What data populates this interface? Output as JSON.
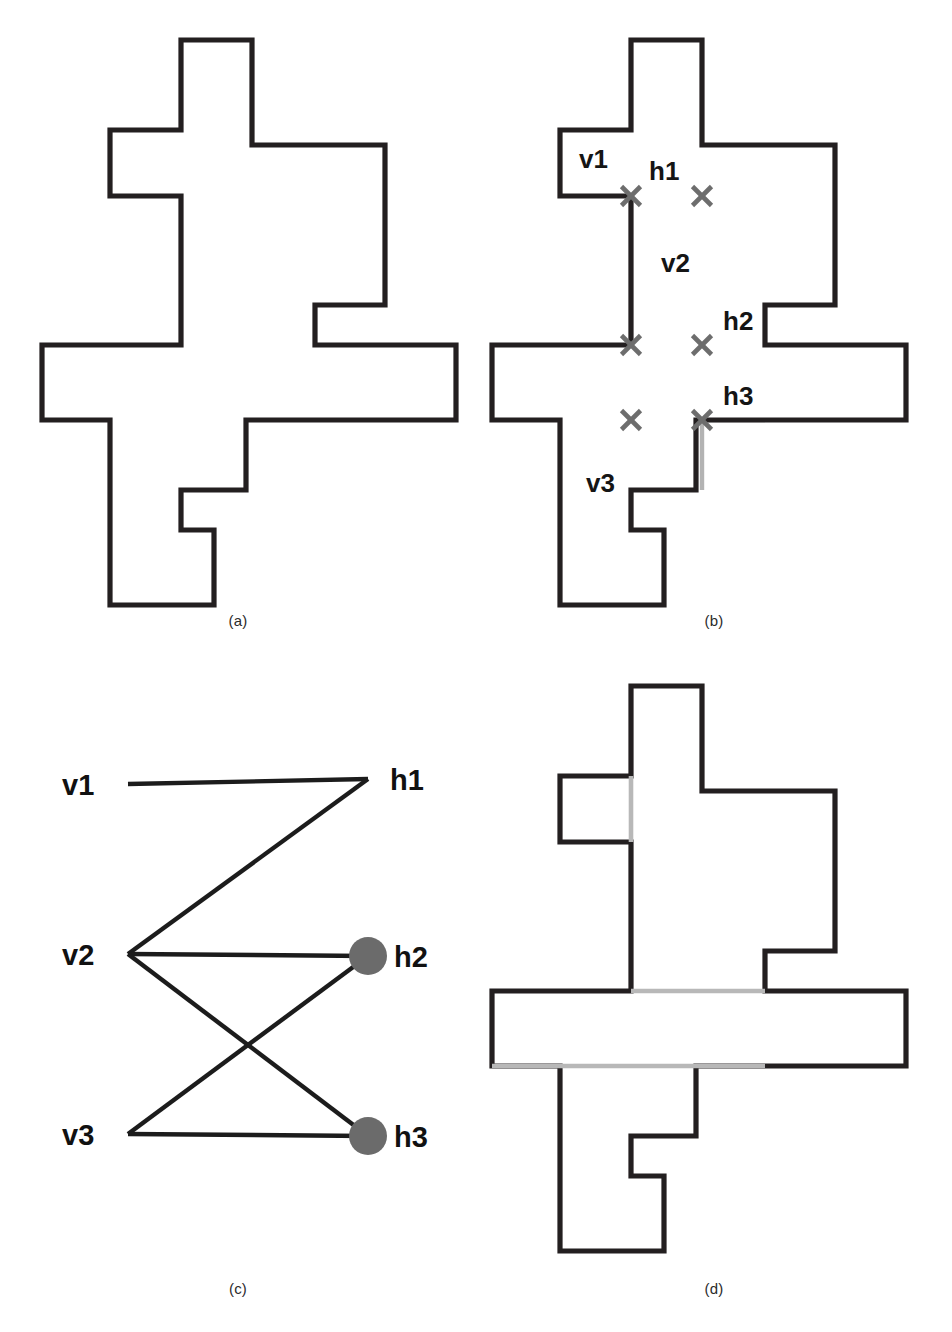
{
  "figure": {
    "panels": [
      {
        "key": "a",
        "caption": "(a)",
        "description": "input rectilinear polygon"
      },
      {
        "key": "b",
        "caption": "(b)",
        "description": "chords and their intersections"
      },
      {
        "key": "c",
        "caption": "(c)",
        "description": "bipartite intersection graph"
      },
      {
        "key": "d",
        "caption": "(d)",
        "description": "polygon partitioned using selected chords"
      }
    ]
  },
  "colors": {
    "outline": "#231f20",
    "chord_gray": "#b3b3b3",
    "cross_gray": "#6d6d6d",
    "node_fill": "#6b6b6b",
    "edge_black": "#1c1c1c",
    "background": "#ffffff"
  },
  "panel_a": {
    "caption": "(a)",
    "polygon_points": "181 40 252 40 252 145 385 145 385 305 315 305 315 345 456 345 456 420 246 420 246 490 181 490 181 530 214 530 214 605 110 605 110 420 42 420 42 345 181 345 181 196 110 196 110 130 181 130"
  },
  "panel_b": {
    "caption": "(b)",
    "polygon_points": "155 40 226 40 226 145 359 145 359 305 289 305 289 345 430 345 430 420 220 420 220 490 155 490 155 530 188 530 188 605 84 605 84 420 16 420 16 345 155 345 155 196 84 196 84 130 155 130",
    "chords": [
      {
        "name": "v1",
        "orientation": "vertical",
        "x1": 155,
        "y1": 130,
        "x2": 155,
        "y2": 196
      },
      {
        "name": "h1",
        "orientation": "horizontal",
        "x1": 155,
        "y1": 196,
        "x2": 226,
        "y2": 196
      },
      {
        "name": "v2",
        "orientation": "vertical",
        "x1": 226,
        "y1": 196,
        "x2": 226,
        "y2": 345
      },
      {
        "name": "h2",
        "orientation": "horizontal",
        "x1": 155,
        "y1": 345,
        "x2": 289,
        "y2": 345
      },
      {
        "name": "h3",
        "orientation": "horizontal",
        "x1": 155,
        "y1": 420,
        "x2": 289,
        "y2": 420
      },
      {
        "name": "v3",
        "orientation": "vertical",
        "x1": 155,
        "y1": 196,
        "x2": 155,
        "y2": 530
      },
      {
        "name": "v2b",
        "orientation": "vertical",
        "x1": 226,
        "y1": 345,
        "x2": 226,
        "y2": 490
      }
    ],
    "intersections": [
      {
        "x": 155,
        "y": 196,
        "between": "v1-h1"
      },
      {
        "x": 226,
        "y": 196,
        "between": "v2-h1"
      },
      {
        "x": 155,
        "y": 345,
        "between": "v3-h2"
      },
      {
        "x": 226,
        "y": 345,
        "between": "v2-h2"
      },
      {
        "x": 155,
        "y": 420,
        "between": "v3-h3"
      },
      {
        "x": 226,
        "y": 420,
        "between": "v2-h3"
      }
    ],
    "labels": [
      {
        "text": "v1",
        "x": 103,
        "y": 168
      },
      {
        "text": "h1",
        "x": 173,
        "y": 180
      },
      {
        "text": "v2",
        "x": 185,
        "y": 272
      },
      {
        "text": "h2",
        "x": 247,
        "y": 330
      },
      {
        "text": "h3",
        "x": 247,
        "y": 405
      },
      {
        "text": "v3",
        "x": 110,
        "y": 492
      }
    ]
  },
  "panel_c": {
    "caption": "(c)",
    "nodes": [
      {
        "id": "v1",
        "label": "v1",
        "x": 128,
        "y": 118,
        "side": "left",
        "filled": true,
        "label_x": 62,
        "label_y": 129
      },
      {
        "id": "v2",
        "label": "v2",
        "x": 128,
        "y": 288,
        "side": "left",
        "filled": false,
        "label_x": 62,
        "label_y": 299
      },
      {
        "id": "v3",
        "label": "v3",
        "x": 128,
        "y": 468,
        "side": "left",
        "filled": false,
        "label_x": 62,
        "label_y": 479
      },
      {
        "id": "h1",
        "label": "h1",
        "x": 368,
        "y": 113,
        "side": "right",
        "filled": false,
        "label_x": 390,
        "label_y": 124
      },
      {
        "id": "h2",
        "label": "h2",
        "x": 368,
        "y": 290,
        "side": "right",
        "filled": true,
        "label_x": 394,
        "label_y": 301
      },
      {
        "id": "h3",
        "label": "h3",
        "x": 368,
        "y": 470,
        "side": "right",
        "filled": true,
        "label_x": 394,
        "label_y": 481
      }
    ],
    "edges": [
      {
        "from": "v1",
        "to": "h1"
      },
      {
        "from": "v2",
        "to": "h1"
      },
      {
        "from": "v2",
        "to": "h2"
      },
      {
        "from": "v2",
        "to": "h3"
      },
      {
        "from": "v3",
        "to": "h2"
      },
      {
        "from": "v3",
        "to": "h3"
      }
    ],
    "node_radius": 19,
    "independent_set": [
      "v1",
      "h2",
      "h3"
    ]
  },
  "panel_d": {
    "caption": "(d)",
    "polygon_points": "155 20 226 20 226 125 359 125 359 285 289 285 289 325 430 325 430 400 220 400 220 470 155 470 155 510 188 510 188 585 84 585 84 400 16 400 16 325 155 325 155 176 84 176 84 110 155 110",
    "cut_chords": [
      {
        "name": "v1",
        "orientation": "vertical",
        "x1": 155,
        "y1": 110,
        "x2": 155,
        "y2": 176
      },
      {
        "name": "h2",
        "orientation": "horizontal",
        "x1": 155,
        "y1": 325,
        "x2": 289,
        "y2": 325
      },
      {
        "name": "h3",
        "orientation": "horizontal",
        "x1": 16,
        "y1": 400,
        "x2": 289,
        "y2": 400
      }
    ]
  },
  "footer": {
    "text": ""
  }
}
